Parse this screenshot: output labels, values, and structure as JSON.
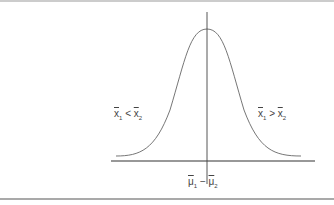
{
  "diagram": {
    "type": "normal-distribution-curve",
    "left_label": {
      "a": "x",
      "a_sub": "1",
      "op": "<",
      "b": "x",
      "b_sub": "2"
    },
    "right_label": {
      "a": "x",
      "a_sub": "1",
      "op": ">",
      "b": "x",
      "b_sub": "2"
    },
    "center_label": {
      "a": "μ",
      "a_sub": "1",
      "op": "−",
      "b": "μ",
      "b_sub": "2"
    },
    "colors": {
      "line": "#555555",
      "axis": "#333333",
      "text": "#444444"
    }
  }
}
